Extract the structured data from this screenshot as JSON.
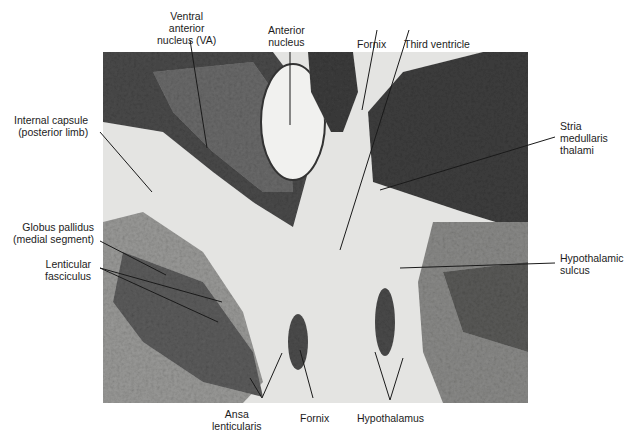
{
  "figure": {
    "type": "histological brain section (myelin stain), coronal, thalamus level",
    "labels": {
      "ventral_anterior": "Ventral\nanterior\nnucleus (VA)",
      "anterior_nucleus": "Anterior\nnucleus",
      "fornix_top": "Fornix",
      "third_ventricle": "Third ventricle",
      "internal_capsule": "Internal capsule\n(posterior limb)",
      "stria_medullaris": "Stria\nmedullaris\nthalami",
      "globus_pallidus": "Globus pallidus\n(medial segment)",
      "lenticular_fasciculus": "Lenticular\nfasciculus",
      "hypothalamic_sulcus": "Hypothalamic\nsulcus",
      "ansa_lenticularis": "Ansa\nlenticularis",
      "fornix_bottom": "Fornix",
      "hypothalamus": "Hypothalamus"
    }
  }
}
